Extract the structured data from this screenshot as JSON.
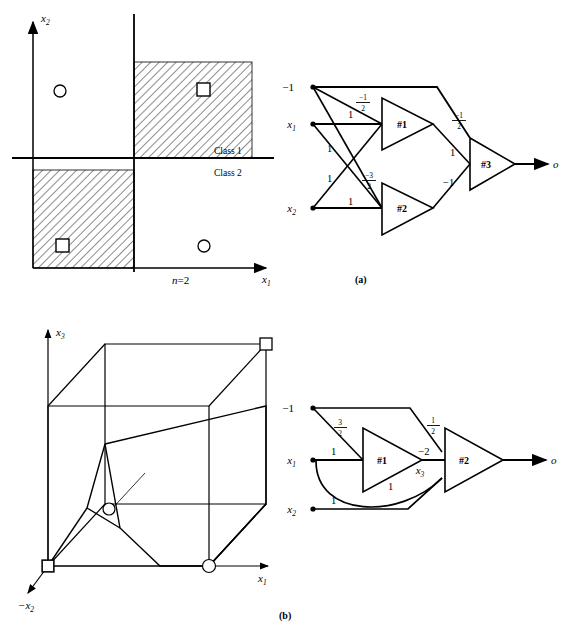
{
  "figure": {
    "caption_a": "(a)",
    "caption_b": "(b)"
  },
  "panel_a_plot": {
    "axis_x": "x",
    "axis_x_sub": "1",
    "axis_y": "x",
    "axis_y_sub": "2",
    "class_1_label": "Class 1",
    "class_2_label": "Class 2",
    "dimension_label": "n=2",
    "markers": [
      {
        "type": "circle",
        "quadrant": "upper-left"
      },
      {
        "type": "square",
        "quadrant": "upper-right"
      },
      {
        "type": "square",
        "quadrant": "lower-left"
      },
      {
        "type": "circle",
        "quadrant": "lower-right"
      }
    ],
    "hatched_quadrants": [
      "upper-right",
      "lower-left"
    ]
  },
  "panel_a_network": {
    "inputs": [
      {
        "name": "bias",
        "label": "−1"
      },
      {
        "name": "x1",
        "label": "x",
        "sub": "1"
      },
      {
        "name": "x2",
        "label": "x",
        "sub": "2"
      }
    ],
    "nodes": [
      {
        "id": "#1"
      },
      {
        "id": "#2"
      },
      {
        "id": "#3"
      }
    ],
    "output_label": "o",
    "weights": {
      "bias_to_n1_num": "−1",
      "bias_to_n1_den": "2",
      "x1_to_n1": "1",
      "x1_to_n2": "1",
      "x2_to_n1": "1",
      "x2_to_n2": "1",
      "bias_to_n2_num": "−3",
      "bias_to_n2_den": "2",
      "bias_to_n3_num": "−1",
      "bias_to_n3_den": "2",
      "n1_to_n3": "1",
      "n2_to_n3": "−1"
    }
  },
  "panel_b_cube": {
    "axis_x": "x",
    "axis_x_sub": "1",
    "axis_y": "x",
    "axis_y_sub": "3",
    "axis_z": "−x",
    "axis_z_sub": "2",
    "markers": [
      {
        "type": "square",
        "position": "origin"
      },
      {
        "type": "square",
        "position": "top-far-right"
      },
      {
        "type": "circle",
        "position": "interior"
      },
      {
        "type": "circle",
        "position": "bottom-right"
      }
    ]
  },
  "panel_b_network": {
    "inputs": [
      {
        "name": "bias",
        "label": "−1"
      },
      {
        "name": "x1",
        "label": "x",
        "sub": "1"
      },
      {
        "name": "x2",
        "label": "x",
        "sub": "2"
      }
    ],
    "nodes": [
      {
        "id": "#1"
      },
      {
        "id": "#2"
      }
    ],
    "output_label": "o",
    "intermediate_label": "x",
    "intermediate_sub": "3",
    "weights": {
      "bias_to_n1_num": "3",
      "bias_to_n1_den": "2",
      "x1_to_n1": "1",
      "x1_to_n2": "1",
      "x2_to_n2": "1",
      "bias_to_n2_num": "1",
      "bias_to_n2_den": "2",
      "n1_to_n2": "−2"
    }
  }
}
